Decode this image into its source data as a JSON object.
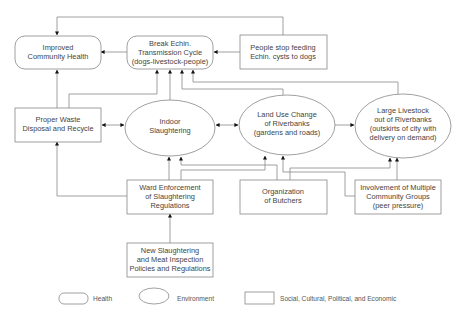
{
  "diagram": {
    "nodes": [
      {
        "id": "improved-health",
        "category": "health",
        "lines": [
          "Improved",
          "Community Health"
        ]
      },
      {
        "id": "break-cycle",
        "category": "health",
        "lines": [
          "Break Echin.",
          "Transmission Cycle",
          "(dogs-livestock-people)"
        ]
      },
      {
        "id": "people-stop",
        "category": "social",
        "lines": [
          "People stop feeding",
          "Echin. cysts to dogs"
        ]
      },
      {
        "id": "proper-waste",
        "category": "social",
        "lines": [
          "Proper Waste",
          "Disposal and Recycle"
        ]
      },
      {
        "id": "indoor-slaughtering",
        "category": "environment",
        "lines": [
          "Indoor",
          "Slaughtering"
        ]
      },
      {
        "id": "land-use",
        "category": "environment",
        "lines": [
          "Land Use Change",
          "of Riverbanks",
          "(gardens and roads)"
        ]
      },
      {
        "id": "large-livestock",
        "category": "environment",
        "lines": [
          "Large Livestock",
          "out of Riverbanks",
          "(outskirts of city with",
          "delivery on demand)"
        ]
      },
      {
        "id": "ward-enforcement",
        "category": "social",
        "lines": [
          "Ward Enforcement",
          "of Slaughtering",
          "Regulations"
        ]
      },
      {
        "id": "organization-butchers",
        "category": "social",
        "lines": [
          "Organization",
          "of Butchers"
        ]
      },
      {
        "id": "involvement-groups",
        "category": "social",
        "lines": [
          "Involvement of Multiple",
          "Community Groups",
          "(peer pressure)"
        ]
      },
      {
        "id": "new-policies",
        "category": "social",
        "lines": [
          "New Slaughtering",
          "and Meat Inspection",
          "Policies and Regulations"
        ]
      }
    ],
    "edges": [
      {
        "from": "break-cycle",
        "to": "improved-health"
      },
      {
        "from": "people-stop",
        "to": "break-cycle"
      },
      {
        "from": "people-stop",
        "to": "improved-health"
      },
      {
        "from": "proper-waste",
        "to": "improved-health"
      },
      {
        "from": "proper-waste",
        "to": "break-cycle"
      },
      {
        "from": "indoor-slaughtering",
        "to": "break-cycle"
      },
      {
        "from": "land-use",
        "to": "break-cycle"
      },
      {
        "from": "large-livestock",
        "to": "break-cycle"
      },
      {
        "from": "proper-waste",
        "to": "indoor-slaughtering",
        "bidirectional": true
      },
      {
        "from": "indoor-slaughtering",
        "to": "land-use",
        "bidirectional": true
      },
      {
        "from": "land-use",
        "to": "large-livestock"
      },
      {
        "from": "ward-enforcement",
        "to": "indoor-slaughtering"
      },
      {
        "from": "ward-enforcement",
        "to": "proper-waste"
      },
      {
        "from": "ward-enforcement",
        "to": "land-use"
      },
      {
        "from": "organization-butchers",
        "to": "indoor-slaughtering"
      },
      {
        "from": "organization-butchers",
        "to": "large-livestock"
      },
      {
        "from": "involvement-groups",
        "to": "land-use"
      },
      {
        "from": "involvement-groups",
        "to": "large-livestock"
      },
      {
        "from": "new-policies",
        "to": "ward-enforcement"
      }
    ]
  },
  "legend": {
    "health": "Health",
    "environment": "Environment",
    "social": "Social, Cultural, Political, and Economic"
  }
}
